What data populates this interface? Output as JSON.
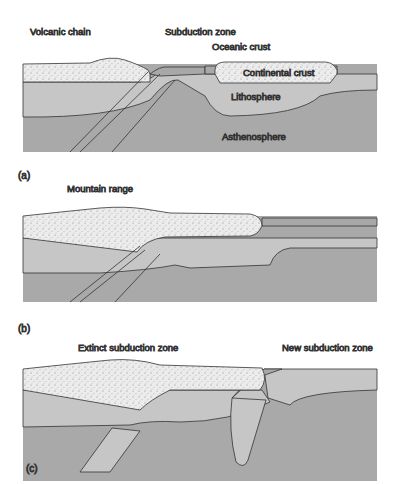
{
  "panels": [
    {
      "id": "a",
      "label": "(a)",
      "annotations": {
        "volcanic": "Volcanic chain",
        "subduction": "Subduction zone",
        "oceanic": "Oceanic crust",
        "continental": "Continental crust",
        "litho": "Lithosphere",
        "astheno": "Asthenosphere"
      }
    },
    {
      "id": "b",
      "label": "(b)",
      "annotations": {
        "mountain": "Mountain range"
      }
    },
    {
      "id": "c",
      "label": "(c)",
      "annotations": {
        "extinct": "Extinct subduction zone",
        "new": "New subduction zone"
      }
    }
  ],
  "colors": {
    "crust": "#ececec",
    "oceanic": "#a8a8a8",
    "litho": "#c6c6c6",
    "astheno": "#a9a9a9",
    "line": "#333333"
  }
}
